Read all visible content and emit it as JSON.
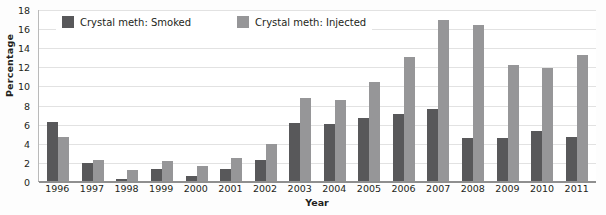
{
  "chart_data": {
    "type": "bar",
    "title": "",
    "xlabel": "Year",
    "ylabel": "Percentage",
    "ylim": [
      0,
      18
    ],
    "ytick_step": 2,
    "yticks": [
      0,
      2,
      4,
      6,
      8,
      10,
      12,
      14,
      16,
      18
    ],
    "grid": true,
    "legend_position": "top-inside",
    "categories": [
      "1996",
      "1997",
      "1998",
      "1999",
      "2000",
      "2001",
      "2002",
      "2003",
      "2004",
      "2005",
      "2006",
      "2007",
      "2008",
      "2009",
      "2010",
      "2011"
    ],
    "series": [
      {
        "name": "Crystal meth: Smoked",
        "color": "#58585a",
        "values": [
          6.2,
          1.9,
          0.2,
          1.3,
          0.5,
          1.3,
          2.2,
          6.1,
          6.0,
          6.6,
          7.0,
          7.5,
          4.5,
          4.5,
          5.2,
          4.6
        ]
      },
      {
        "name": "Crystal meth: Injected",
        "color": "#969698",
        "values": [
          4.6,
          2.2,
          1.2,
          2.1,
          1.6,
          2.4,
          3.9,
          8.7,
          8.5,
          10.4,
          13.0,
          16.8,
          16.3,
          12.1,
          11.8,
          13.2
        ]
      }
    ]
  },
  "colors": {
    "smoked": "#58585a",
    "injected": "#969698",
    "gridline": "#e2e2e2",
    "axis": "#8f8f8f",
    "text": "#231f20",
    "plot_background": "#ffffff"
  }
}
